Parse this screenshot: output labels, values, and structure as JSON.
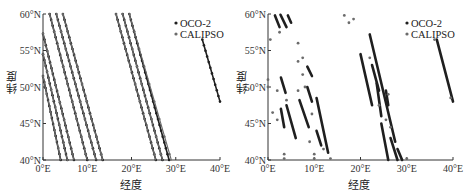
{
  "colors": {
    "oco2": "#1f1f1f",
    "calipso": "#6b6b6b",
    "axis": "#333333",
    "background": "#ffffff"
  },
  "chart_data": [
    {
      "type": "scatter",
      "panel": "left",
      "title": "",
      "xlabel": "经度",
      "ylabel": "纬度",
      "xlim": [
        0,
        40
      ],
      "ylim": [
        40,
        60
      ],
      "xticks": [
        "0°E",
        "10°E",
        "20°E",
        "30°E",
        "40°E"
      ],
      "yticks": [
        "40°N",
        "45°N",
        "50°N",
        "55°N",
        "60°N"
      ],
      "grid": false,
      "legend": {
        "position": "upper right",
        "entries": [
          "OCO-2",
          "CALIPSO"
        ]
      },
      "description": "Continuous satellite ground tracks (lat/lon of footprints); tracks run from NW to SE, dense contiguous coverage",
      "series": [
        {
          "name": "OCO-2",
          "tracks": [
            {
              "start": [
                1.5,
                60
              ],
              "end": [
                10.0,
                40
              ]
            },
            {
              "start": [
                3.0,
                60
              ],
              "end": [
                12.0,
                40
              ]
            },
            {
              "start": [
                4.5,
                60
              ],
              "end": [
                13.5,
                40
              ]
            },
            {
              "start": [
                16.5,
                60
              ],
              "end": [
                25.5,
                40
              ]
            },
            {
              "start": [
                18.0,
                60
              ],
              "end": [
                27.0,
                40
              ]
            },
            {
              "start": [
                19.5,
                60
              ],
              "end": [
                28.5,
                40
              ]
            },
            {
              "start": [
                36.0,
                56.5
              ],
              "end": [
                40.0,
                48.0
              ]
            },
            {
              "start": [
                0.0,
                57.3
              ],
              "end": [
                7.0,
                40
              ]
            },
            {
              "start": [
                0.0,
                54.5
              ],
              "end": [
                5.5,
                40
              ]
            },
            {
              "start": [
                0.0,
                51.5
              ],
              "end": [
                4.0,
                40
              ]
            }
          ]
        },
        {
          "name": "CALIPSO",
          "tracks": [
            {
              "start": [
                1.5,
                60
              ],
              "end": [
                10.0,
                40
              ]
            },
            {
              "start": [
                3.0,
                60
              ],
              "end": [
                12.0,
                40
              ]
            },
            {
              "start": [
                4.5,
                60
              ],
              "end": [
                13.5,
                40
              ]
            },
            {
              "start": [
                16.5,
                60
              ],
              "end": [
                25.5,
                40
              ]
            },
            {
              "start": [
                18.0,
                60
              ],
              "end": [
                27.0,
                40
              ]
            },
            {
              "start": [
                19.5,
                60
              ],
              "end": [
                29.0,
                40
              ]
            },
            {
              "start": [
                0.0,
                57.3
              ],
              "end": [
                7.0,
                40
              ]
            },
            {
              "start": [
                0.0,
                54.5
              ],
              "end": [
                5.5,
                40
              ]
            },
            {
              "start": [
                0.0,
                51.5
              ],
              "end": [
                4.0,
                40
              ]
            }
          ]
        }
      ]
    },
    {
      "type": "scatter",
      "panel": "right",
      "title": "",
      "xlabel": "经度",
      "ylabel": "纬度",
      "xlim": [
        0,
        40
      ],
      "ylim": [
        40,
        60
      ],
      "xticks": [
        "0°E",
        "10°E",
        "20°E",
        "30°E",
        "40°E"
      ],
      "yticks": [
        "40°N",
        "45°N",
        "50°N",
        "55°N",
        "60°N"
      ],
      "grid": false,
      "legend": {
        "position": "upper right",
        "entries": [
          "OCO-2",
          "CALIPSO"
        ]
      },
      "description": "Matched/filtered footprints: fragmented track segments along same orbits",
      "series": [
        {
          "name": "OCO-2",
          "segments": [
            {
              "start": [
                1.5,
                59.8
              ],
              "end": [
                2.5,
                58.2
              ]
            },
            {
              "start": [
                2.7,
                59.9
              ],
              "end": [
                4.0,
                58.2
              ]
            },
            {
              "start": [
                4.3,
                59.8
              ],
              "end": [
                5.0,
                58.8
              ]
            },
            {
              "start": [
                2.8,
                51.3
              ],
              "end": [
                3.8,
                49.2
              ]
            },
            {
              "start": [
                2.8,
                47.0
              ],
              "end": [
                3.5,
                44.5
              ]
            },
            {
              "start": [
                4.0,
                47.5
              ],
              "end": [
                6.0,
                43.0
              ]
            },
            {
              "start": [
                6.8,
                48.2
              ],
              "end": [
                8.8,
                44.5
              ]
            },
            {
              "start": [
                8.5,
                52.8
              ],
              "end": [
                9.5,
                51.5
              ]
            },
            {
              "start": [
                8.5,
                50.0
              ],
              "end": [
                9.5,
                48.0
              ]
            },
            {
              "start": [
                10.5,
                48.5
              ],
              "end": [
                13.0,
                41.0
              ]
            },
            {
              "start": [
                10.5,
                44.0
              ],
              "end": [
                11.5,
                42.0
              ]
            },
            {
              "start": [
                20.0,
                54.5
              ],
              "end": [
                22.5,
                47.5
              ]
            },
            {
              "start": [
                22.0,
                57.2
              ],
              "end": [
                27.5,
                42.5
              ]
            },
            {
              "start": [
                22.5,
                53.0
              ],
              "end": [
                24.0,
                49.5
              ]
            },
            {
              "start": [
                23.5,
                50.5
              ],
              "end": [
                24.5,
                46.0
              ]
            },
            {
              "start": [
                25.5,
                49.5
              ],
              "end": [
                26.0,
                47.5
              ]
            },
            {
              "start": [
                24.5,
                45.0
              ],
              "end": [
                26.0,
                40.0
              ]
            },
            {
              "start": [
                26.5,
                43.0
              ],
              "end": [
                28.0,
                40.0
              ]
            },
            {
              "start": [
                28.0,
                41.5
              ],
              "end": [
                29.0,
                40.0
              ]
            },
            {
              "start": [
                36.5,
                56.5
              ],
              "end": [
                40.0,
                48.0
              ]
            }
          ]
        },
        {
          "name": "CALIPSO",
          "points": [
            [
              0.0,
              51.0
            ],
            [
              0.0,
              50.0
            ],
            [
              0.5,
              56.5
            ],
            [
              1.0,
              46.5
            ],
            [
              2.0,
              49.5
            ],
            [
              2.0,
              45.5
            ],
            [
              2.5,
              57.5
            ],
            [
              3.5,
              40.8
            ],
            [
              3.5,
              40.2
            ],
            [
              4.0,
              48.2
            ],
            [
              6.5,
              56.0
            ],
            [
              6.5,
              53.5
            ],
            [
              6.5,
              49.5
            ],
            [
              7.5,
              54.0
            ],
            [
              7.5,
              51.7
            ],
            [
              8.0,
              50.0
            ],
            [
              9.0,
              42.5
            ],
            [
              9.5,
              46.3
            ],
            [
              10.0,
              40.8
            ],
            [
              10.0,
              40.2
            ],
            [
              12.0,
              41.5
            ],
            [
              13.5,
              40.2
            ],
            [
              16.5,
              59.8
            ],
            [
              17.5,
              58.8
            ],
            [
              18.5,
              59.3
            ],
            [
              22.0,
              54.0
            ],
            [
              24.0,
              47.5
            ],
            [
              25.5,
              45.5
            ],
            [
              26.0,
              49.0
            ],
            [
              26.5,
              44.5
            ],
            [
              30.0,
              40.2
            ],
            [
              36.0,
              56.5
            ],
            [
              39.5,
              48.5
            ]
          ]
        }
      ]
    }
  ],
  "left_panel": {
    "yticks": [
      "60°N",
      "55°N",
      "50°N",
      "45°N",
      "40°N"
    ],
    "xticks": [
      "0°E",
      "10°E",
      "20°E",
      "30°E",
      "40°E"
    ],
    "ylabel": "纬度",
    "xlabel": "经度",
    "legend": {
      "oco2": "OCO-2",
      "calipso": "CALIPSO"
    }
  },
  "right_panel": {
    "yticks": [
      "60°N",
      "55°N",
      "50°N",
      "45°N",
      "40°N"
    ],
    "xticks": [
      "0°E",
      "10°E",
      "20°E",
      "30°E",
      "40°E"
    ],
    "ylabel": "纬度",
    "xlabel": "经度",
    "legend": {
      "oco2": "OCO-2",
      "calipso": "CALIPSO"
    }
  }
}
